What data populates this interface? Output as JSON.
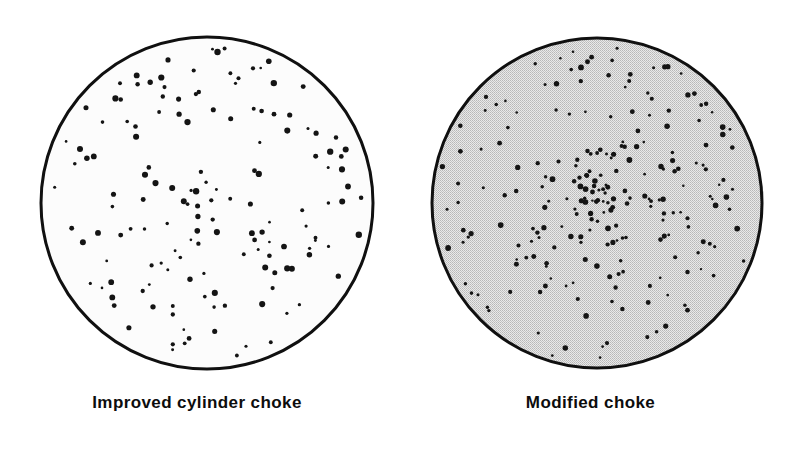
{
  "figure": {
    "background_color": "#ffffff",
    "ink_color": "#111111"
  },
  "panels": [
    {
      "id": "improved-cylinder",
      "caption": "Improved cylinder choke",
      "circle": {
        "cx": 207,
        "cy": 203,
        "r": 166,
        "stroke_color": "#101010",
        "stroke_width": 3,
        "fill_color": "#fbfbfb",
        "fill_style": "plain"
      },
      "pellets": {
        "count": 152,
        "color": "#141414",
        "min_radius": 1.3,
        "max_radius": 3.2,
        "distribution": "even-open-spread",
        "center_bias": 0.35
      }
    },
    {
      "id": "modified",
      "caption": "Modified choke",
      "circle": {
        "cx": 597,
        "cy": 203,
        "r": 165,
        "stroke_color": "#101010",
        "stroke_width": 3,
        "fill_color": "#d6d6d6",
        "fill_style": "halftone-screen"
      },
      "pellets": {
        "count": 236,
        "color": "#141414",
        "min_radius": 1.2,
        "max_radius": 2.9,
        "distribution": "dense-center-weighted",
        "center_bias": 0.62
      }
    }
  ],
  "chart_data": {
    "type": "scatter",
    "subtitle": "",
    "xlabel": "",
    "ylabel": "",
    "grid": false,
    "legend_position": "below-each-panel",
    "series": [
      {
        "name": "Improved cylinder choke",
        "pellet_count": 152,
        "pattern_circle_radius": 166,
        "density": "open",
        "fill": "white"
      },
      {
        "name": "Modified choke",
        "pellet_count": 236,
        "pattern_circle_radius": 165,
        "density": "tight",
        "fill": "gray-halftone"
      }
    ],
    "annotations": [
      "Improved cylinder choke",
      "Modified choke"
    ]
  }
}
